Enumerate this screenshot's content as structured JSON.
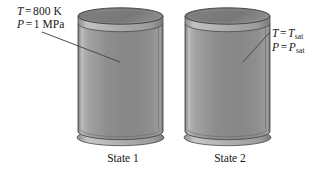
{
  "figure": {
    "background_color": "#ffffff"
  },
  "labels": {
    "state1": {
      "line1": {
        "variable": "T",
        "equals": "=",
        "value": "800 K"
      },
      "line2": {
        "variable": "P",
        "equals": "=",
        "value": "1 MPa"
      }
    },
    "state2": {
      "line1": {
        "variable": "T",
        "equals": "=",
        "value": "T",
        "subscript": "sat"
      },
      "line2": {
        "variable": "P",
        "equals": "=",
        "value": "P",
        "subscript": "sat"
      }
    }
  },
  "captions": {
    "cylinder1": "State 1",
    "cylinder2": "State 2"
  },
  "colors": {
    "body_light": "#b4b4b4",
    "body_mid": "#8d8d8d",
    "body_dark": "#6f6f6f",
    "lid_top": "#7a7a7a",
    "lid_rim": "#a6a6a6",
    "base_rim": "#9a9a9a",
    "outline": "#3a3a3a",
    "leader_line": "#4a4a4a",
    "text": "#161616"
  },
  "geometry": {
    "cylinder1": {
      "left": 78,
      "right": 163,
      "top": 15,
      "bottom": 142
    },
    "cylinder2": {
      "left": 185,
      "right": 270,
      "top": 15,
      "bottom": 142
    },
    "leader1": {
      "x1": 42,
      "y1": 32,
      "x2": 120,
      "y2": 62
    },
    "leader2": {
      "x1": 270,
      "y1": 32,
      "x2": 243,
      "y2": 62
    }
  }
}
